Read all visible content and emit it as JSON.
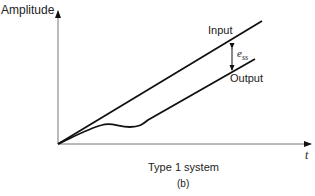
{
  "figure": {
    "y_axis_label": "Amplitude",
    "x_axis_label": "t",
    "input_label": "Input",
    "output_label": "Output",
    "error_label_main": "e",
    "error_label_sub": "ss",
    "caption": "Type 1 system",
    "subfigure": "(b)"
  },
  "colors": {
    "line": "#111111",
    "axis": "#777777"
  }
}
